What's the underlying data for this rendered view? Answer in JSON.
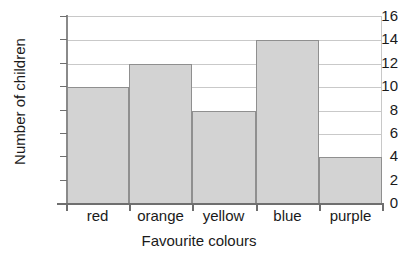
{
  "chart_data": {
    "type": "bar",
    "title": "",
    "xlabel": "Favourite colours",
    "ylabel": "Number of children",
    "categories": [
      "red",
      "orange",
      "yellow",
      "blue",
      "purple"
    ],
    "values": [
      10,
      12,
      8,
      14,
      4
    ],
    "ylim": [
      0,
      16
    ],
    "ytick_values": [
      0,
      2,
      4,
      6,
      8,
      10,
      12,
      14,
      16
    ],
    "ytick_labels": [
      "0",
      "2",
      "4",
      "6",
      "8",
      "10",
      "12",
      "14",
      "16"
    ],
    "grid": true,
    "legend": "none",
    "bar_fill_color": "#d3d3d3",
    "bar_edge_color": "#8f8f8f",
    "gridline_color": "#c9c9c9",
    "axis_color": "#6f6f6f",
    "background_color": "#ffffff"
  }
}
